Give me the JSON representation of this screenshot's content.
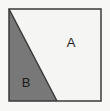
{
  "figure": {
    "canvas": {
      "width": 110,
      "height": 111
    },
    "background_color": "#f7f7f5",
    "square": {
      "x": 9,
      "y": 9,
      "width": 92,
      "height": 92,
      "border_color": "#3a3a3a",
      "border_width": 1.5
    },
    "divider": {
      "type": "diagonal-line",
      "from": {
        "x": 9,
        "y": 9
      },
      "to": {
        "x": 57,
        "y": 101
      },
      "color": "#3a3a3a",
      "width": 1.5
    },
    "regions": [
      {
        "id": "region-a",
        "label": "A",
        "shape": "quadrilateral",
        "fill_color": "#f5f5f3",
        "points": "9,9 101,9 101,101 57,101",
        "label_x": 71,
        "label_y": 44
      },
      {
        "id": "region-b",
        "label": "B",
        "shape": "triangle",
        "fill_color": "#787878",
        "points": "9,9 57,101 9,101",
        "label_x": 26,
        "label_y": 84
      }
    ],
    "label_color": "#1c1c1c"
  }
}
